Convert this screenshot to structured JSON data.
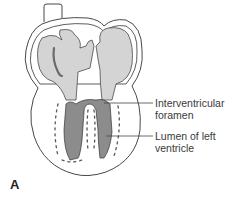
{
  "figure": {
    "panel_letter": "A",
    "labels": [
      {
        "id": "interventricular-foramen",
        "line1": "Interventricular",
        "line2": "foramen"
      },
      {
        "id": "lumen-left-ventricle",
        "line1": "Lumen of left",
        "line2": "ventricle"
      }
    ],
    "colors": {
      "outline": "#333333",
      "atrium_fill": "#d4d4d4",
      "ventricle_fill": "#8c8c8c",
      "leader_line": "#444444",
      "text": "#3a3a3a"
    }
  }
}
